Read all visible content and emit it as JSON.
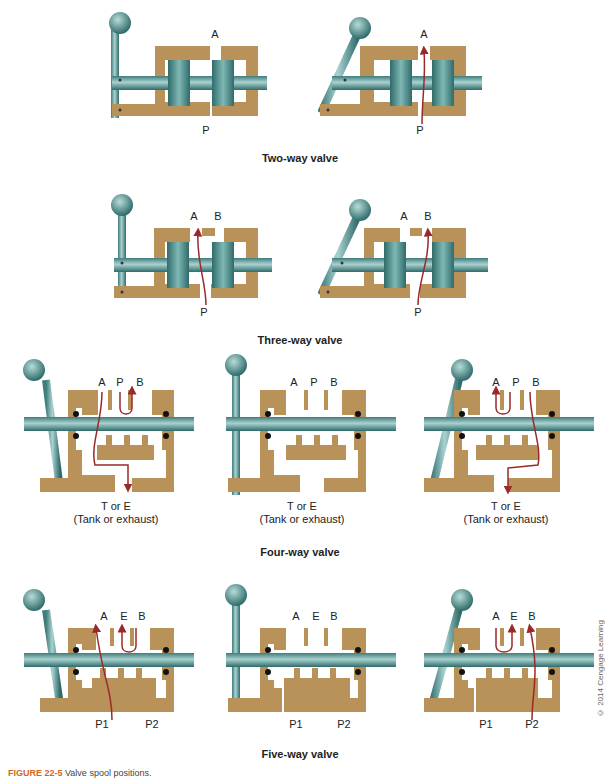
{
  "figure": {
    "caption_label": "FIGURE 22-5",
    "caption_text": "Valve spool positions.",
    "copyright": "© 2014 Cengage Learning"
  },
  "colors": {
    "body_brass": "#b9925a",
    "spool_teal": "#4f8f8f",
    "flow_arrow": "#9a2a2a",
    "seal_black": "#111111"
  },
  "sections": [
    {
      "title": "Two-way valve",
      "diagrams": [
        {
          "state": "closed",
          "ports": [
            "A",
            "P"
          ],
          "flow": "none"
        },
        {
          "state": "open",
          "ports": [
            "A",
            "P"
          ],
          "flow": "P → A"
        }
      ]
    },
    {
      "title": "Three-way valve",
      "diagrams": [
        {
          "state": "P to A",
          "ports": [
            "A",
            "B",
            "P"
          ],
          "flow": "P → A"
        },
        {
          "state": "P to B",
          "ports": [
            "A",
            "B",
            "P"
          ],
          "flow": "P → B"
        }
      ]
    },
    {
      "title": "Four-way valve",
      "diagrams": [
        {
          "state": "left",
          "ports": [
            "A",
            "P",
            "B"
          ],
          "bottom_port": "T or E",
          "bottom_note": "(Tank or exhaust)",
          "flow": "P → B, A → T"
        },
        {
          "state": "center",
          "ports": [
            "A",
            "P",
            "B"
          ],
          "bottom_port": "T or E",
          "bottom_note": "(Tank or exhaust)",
          "flow": "none"
        },
        {
          "state": "right",
          "ports": [
            "A",
            "P",
            "B"
          ],
          "bottom_port": "T or E",
          "bottom_note": "(Tank or exhaust)",
          "flow": "P → A, B → T"
        }
      ]
    },
    {
      "title": "Five-way valve",
      "diagrams": [
        {
          "state": "left",
          "ports": [
            "A",
            "E",
            "B"
          ],
          "bottom_ports": [
            "P1",
            "P2"
          ],
          "flow": "P1 → A, B → E"
        },
        {
          "state": "center",
          "ports": [
            "A",
            "E",
            "B"
          ],
          "bottom_ports": [
            "P1",
            "P2"
          ],
          "flow": "none"
        },
        {
          "state": "right",
          "ports": [
            "A",
            "E",
            "B"
          ],
          "bottom_ports": [
            "P1",
            "P2"
          ],
          "flow": "P2 → B, A → E"
        }
      ]
    }
  ]
}
